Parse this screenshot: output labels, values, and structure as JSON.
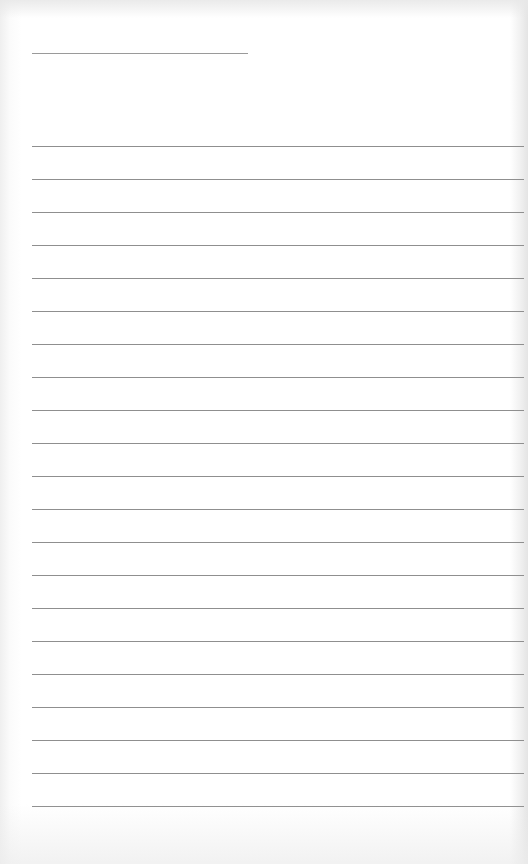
{
  "document": {
    "type": "lined-paper",
    "header_line": {
      "label": "",
      "value": ""
    },
    "line_count": 21,
    "lines": [
      "",
      "",
      "",
      "",
      "",
      "",
      "",
      "",
      "",
      "",
      "",
      "",
      "",
      "",
      "",
      "",
      "",
      "",
      "",
      "",
      ""
    ],
    "colors": {
      "paper": "#ffffff",
      "rule": "#8f8f8f"
    }
  }
}
